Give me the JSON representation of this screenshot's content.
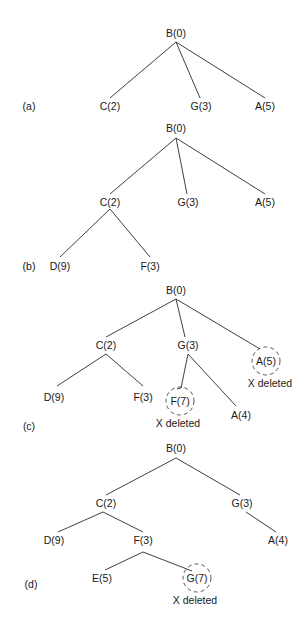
{
  "figure": {
    "panels": [
      {
        "id": "a",
        "label": "(a)",
        "nodes": [
          {
            "id": "B0",
            "text": "B(0)",
            "deleted": false
          },
          {
            "id": "C2",
            "text": "C(2)",
            "deleted": false
          },
          {
            "id": "G3",
            "text": "G(3)",
            "deleted": false
          },
          {
            "id": "A5",
            "text": "A(5)",
            "deleted": false
          }
        ],
        "edges": [
          [
            "B0",
            "C2"
          ],
          [
            "B0",
            "G3"
          ],
          [
            "B0",
            "A5"
          ]
        ]
      },
      {
        "id": "b",
        "label": "(b)",
        "nodes": [
          {
            "id": "B0",
            "text": "B(0)",
            "deleted": false
          },
          {
            "id": "C2",
            "text": "C(2)",
            "deleted": false
          },
          {
            "id": "G3",
            "text": "G(3)",
            "deleted": false
          },
          {
            "id": "A5",
            "text": "A(5)",
            "deleted": false
          },
          {
            "id": "D9",
            "text": "D(9)",
            "deleted": false
          },
          {
            "id": "F3",
            "text": "F(3)",
            "deleted": false
          }
        ],
        "edges": [
          [
            "B0",
            "C2"
          ],
          [
            "B0",
            "G3"
          ],
          [
            "B0",
            "A5"
          ],
          [
            "C2",
            "D9"
          ],
          [
            "C2",
            "F3"
          ]
        ]
      },
      {
        "id": "c",
        "label": "(c)",
        "nodes": [
          {
            "id": "B0",
            "text": "B(0)",
            "deleted": false
          },
          {
            "id": "C2",
            "text": "C(2)",
            "deleted": false
          },
          {
            "id": "G3",
            "text": "G(3)",
            "deleted": false
          },
          {
            "id": "A5",
            "text": "A(5)",
            "deleted": true
          },
          {
            "id": "D9",
            "text": "D(9)",
            "deleted": false
          },
          {
            "id": "F3",
            "text": "F(3)",
            "deleted": false
          },
          {
            "id": "F7",
            "text": "F(7)",
            "deleted": true
          },
          {
            "id": "A4",
            "text": "A(4)",
            "deleted": false
          }
        ],
        "edges": [
          [
            "B0",
            "C2"
          ],
          [
            "B0",
            "G3"
          ],
          [
            "B0",
            "A5"
          ],
          [
            "C2",
            "D9"
          ],
          [
            "C2",
            "F3"
          ],
          [
            "G3",
            "F7"
          ],
          [
            "G3",
            "A4"
          ]
        ]
      },
      {
        "id": "d",
        "label": "(d)",
        "nodes": [
          {
            "id": "B0",
            "text": "B(0)",
            "deleted": false
          },
          {
            "id": "C2",
            "text": "C(2)",
            "deleted": false
          },
          {
            "id": "G3",
            "text": "G(3)",
            "deleted": false
          },
          {
            "id": "D9",
            "text": "D(9)",
            "deleted": false
          },
          {
            "id": "F3",
            "text": "F(3)",
            "deleted": false
          },
          {
            "id": "A4",
            "text": "A(4)",
            "deleted": false
          },
          {
            "id": "E5",
            "text": "E(5)",
            "deleted": false
          },
          {
            "id": "G7",
            "text": "G(7)",
            "deleted": true
          }
        ],
        "edges": [
          [
            "B0",
            "C2"
          ],
          [
            "B0",
            "G3"
          ],
          [
            "C2",
            "D9"
          ],
          [
            "C2",
            "F3"
          ],
          [
            "G3",
            "A4"
          ],
          [
            "F3",
            "E5"
          ],
          [
            "F3",
            "G7"
          ]
        ]
      }
    ],
    "deleted_caption": "X deleted"
  }
}
